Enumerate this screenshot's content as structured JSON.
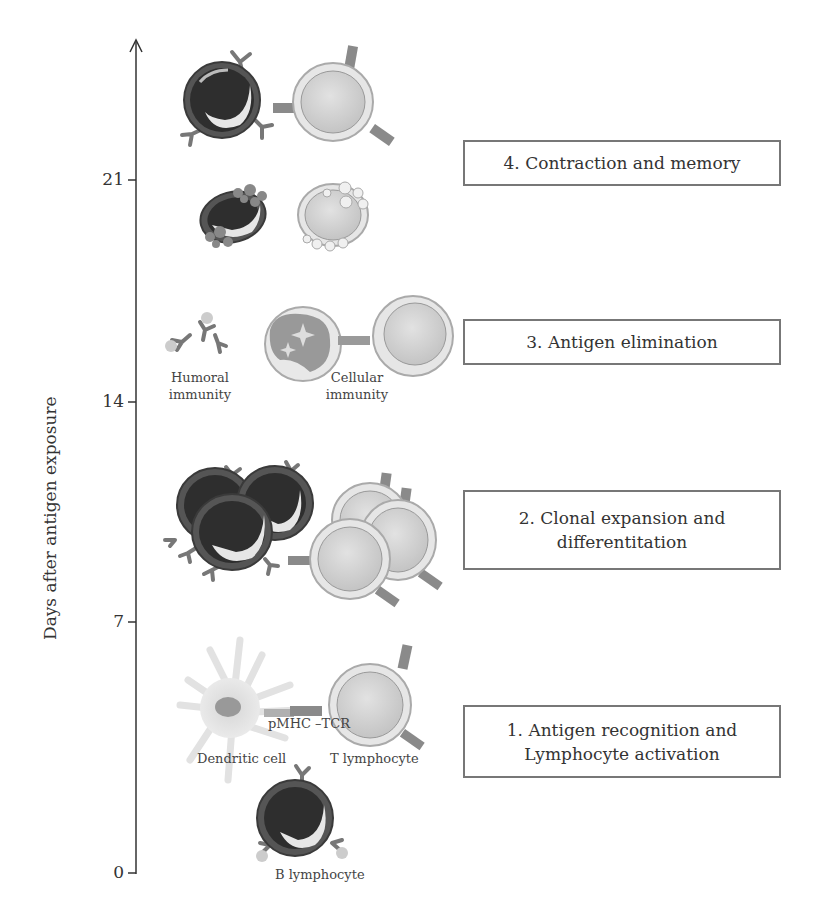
{
  "axis": {
    "title": "Days after antigen exposure",
    "ticks": [
      {
        "label": "21",
        "value": 21
      },
      {
        "label": "14",
        "value": 14
      },
      {
        "label": "7",
        "value": 7
      },
      {
        "label": "0",
        "value": 0
      }
    ]
  },
  "stages": [
    {
      "id": 4,
      "label": "4. Contraction and memory"
    },
    {
      "id": 3,
      "label": "3. Antigen elimination"
    },
    {
      "id": 2,
      "line1": "2. Clonal expansion and",
      "line2": "differentitation"
    },
    {
      "id": 1,
      "line1": "1. Antigen recognition and",
      "line2": "Lymphocyte activation"
    }
  ],
  "labels": {
    "humoral_line1": "Humoral",
    "humoral_line2": "immunity",
    "cellular_line1": "Cellular",
    "cellular_line2": "immunity",
    "pmhc_tcr": "pMHC –TCR",
    "dendritic_cell": "Dendritic cell",
    "t_lymphocyte": "T lymphocyte",
    "b_lymphocyte": "B lymphocyte"
  },
  "colors": {
    "axis": "#333333",
    "box_border": "#777777",
    "b_cell_nucleus": "#3a3a3a",
    "t_cell_fill": "#d4d4d4",
    "receptor": "#8a8a8a"
  }
}
